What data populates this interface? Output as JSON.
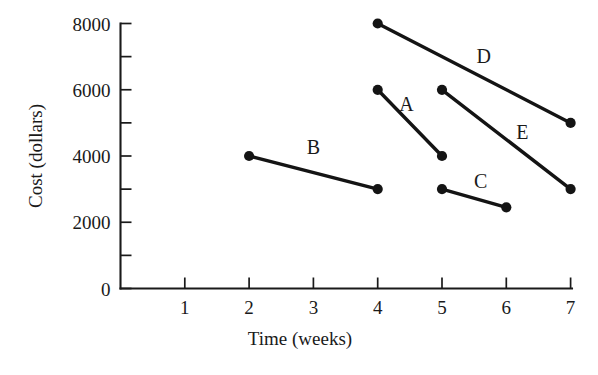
{
  "chart_data": {
    "type": "line",
    "title": "",
    "xlabel": "Time (weeks)",
    "ylabel": "Cost (dollars)",
    "xlim": [
      0,
      7.2
    ],
    "ylim": [
      0,
      8000
    ],
    "grid": false,
    "legend_position": "inline-labels",
    "x_ticks": [
      1,
      2,
      3,
      4,
      5,
      6,
      7
    ],
    "x_tick_labels": [
      "1",
      "2",
      "3",
      "4",
      "5",
      "6",
      "7"
    ],
    "y_ticks": [
      0,
      2000,
      4000,
      6000,
      8000
    ],
    "y_tick_labels": [
      "0",
      "2000",
      "4000",
      "6000",
      "8000"
    ],
    "y_minor_ticks": [
      1000,
      3000,
      5000,
      7000
    ],
    "series": [
      {
        "name": "A",
        "label": "A",
        "label_x": 4.45,
        "label_y": 5350,
        "x": [
          4,
          5
        ],
        "y": [
          6000,
          4000
        ]
      },
      {
        "name": "B",
        "label": "B",
        "label_x": 3.0,
        "label_y": 4050,
        "x": [
          2,
          4
        ],
        "y": [
          4000,
          3000
        ]
      },
      {
        "name": "C",
        "label": "C",
        "label_x": 5.6,
        "label_y": 3050,
        "x": [
          5,
          6
        ],
        "y": [
          3000,
          2450
        ]
      },
      {
        "name": "D",
        "label": "D",
        "label_x": 5.65,
        "label_y": 6800,
        "x": [
          4,
          7
        ],
        "y": [
          8000,
          5000
        ]
      },
      {
        "name": "E",
        "label": "E",
        "label_x": 6.25,
        "label_y": 4500,
        "x": [
          5,
          7
        ],
        "y": [
          6000,
          3000
        ]
      }
    ]
  },
  "axes": {
    "x_title": "Time (weeks)",
    "y_title": "Cost (dollars)"
  },
  "colors": {
    "background": "#ffffff",
    "ink": "#1a1a1a",
    "series": "#141414"
  }
}
